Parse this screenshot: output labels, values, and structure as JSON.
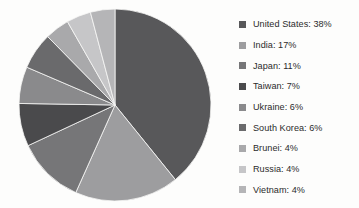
{
  "chart_data": {
    "type": "pie",
    "title": "",
    "subtitle": "",
    "xlabel": "",
    "ylabel": "",
    "grid": false,
    "legend_position": "right",
    "units": "percent",
    "start_angle_deg": 0,
    "direction": "clockwise",
    "categories": [
      "United States",
      "India",
      "Japan",
      "Taiwan",
      "Ukraine",
      "South Korea",
      "Brunei",
      "Russia",
      "Vietnam"
    ],
    "values": [
      38,
      17,
      11,
      7,
      6,
      6,
      4,
      4,
      4
    ],
    "total": 97,
    "slices": [
      {
        "label": "United States",
        "value": 38,
        "display": "United States: 38%",
        "color": "#58585a"
      },
      {
        "label": "India",
        "value": 17,
        "display": "India: 17%",
        "color": "#9d9d9f"
      },
      {
        "label": "Japan",
        "value": 11,
        "display": "Japan: 11%",
        "color": "#767678"
      },
      {
        "label": "Taiwan",
        "value": 7,
        "display": "Taiwan: 7%",
        "color": "#4a4a4c"
      },
      {
        "label": "Ukraine",
        "value": 6,
        "display": "Ukraine: 6%",
        "color": "#8a8a8c"
      },
      {
        "label": "South Korea",
        "value": 6,
        "display": "South Korea: 6%",
        "color": "#6a6a6c"
      },
      {
        "label": "Brunei",
        "value": 4,
        "display": "Brunei: 4%",
        "color": "#a9a9ab"
      },
      {
        "label": "Russia",
        "value": 4,
        "display": "Russia: 4%",
        "color": "#c6c6c8"
      },
      {
        "label": "Vietnam",
        "value": 4,
        "display": "Vietnam: 4%",
        "color": "#b5b5b7"
      }
    ]
  },
  "legend": {
    "items": [
      {
        "text": "United States: 38%",
        "color": "#58585a"
      },
      {
        "text": "India: 17%",
        "color": "#9d9d9f"
      },
      {
        "text": "Japan: 11%",
        "color": "#767678"
      },
      {
        "text": "Taiwan: 7%",
        "color": "#4a4a4c"
      },
      {
        "text": "Ukraine: 6%",
        "color": "#8a8a8c"
      },
      {
        "text": "South Korea: 6%",
        "color": "#6a6a6c"
      },
      {
        "text": "Brunei: 4%",
        "color": "#a9a9ab"
      },
      {
        "text": "Russia: 4%",
        "color": "#c6c6c8"
      },
      {
        "text": "Vietnam: 4%",
        "color": "#b5b5b7"
      }
    ]
  },
  "colors": {
    "background": "#fdfdfc",
    "text": "#2b2b2b",
    "slice_edge": "#f7f7f6"
  }
}
